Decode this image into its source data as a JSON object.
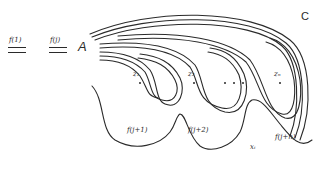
{
  "diagram": {
    "type": "contour deformation diagram",
    "left_labels": [
      {
        "text": "f(1)",
        "underline": "double"
      },
      {
        "text": "f(j)",
        "underline": "double"
      }
    ],
    "base_point": "A",
    "region_label": "C",
    "poles": [
      {
        "label": "z₁"
      },
      {
        "label": "z₂"
      },
      {
        "label": "zₙ"
      }
    ],
    "ellipsis": "• • •",
    "sheet_labels": [
      "f(j+1)",
      "f(j+2)",
      "f(j+n)"
    ],
    "point_label": "xᵢ",
    "stroke_color": "#2a2a2a",
    "background_color": "#ffffff"
  }
}
